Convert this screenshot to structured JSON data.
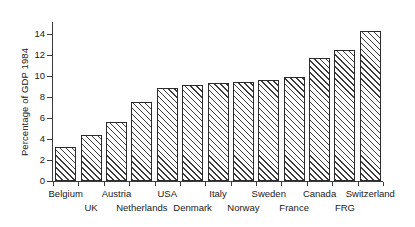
{
  "chart_data": {
    "type": "bar",
    "title": "",
    "subtitle": "",
    "xlabel": "",
    "ylabel": "Percentage of GDP 1984",
    "categories": [
      "Belgium",
      "UK",
      "Austria",
      "Netherlands",
      "USA",
      "Denmark",
      "Italy",
      "Norway",
      "Sweden",
      "France",
      "Canada",
      "FRG",
      "Switzerland"
    ],
    "values": [
      3.25,
      4.4,
      5.6,
      7.5,
      8.85,
      9.15,
      9.3,
      9.4,
      9.6,
      9.85,
      11.7,
      12.4,
      14.2
    ],
    "series": [
      {
        "name": "Percentage of GDP 1984",
        "values": [
          3.25,
          4.4,
          5.6,
          7.5,
          8.85,
          9.15,
          9.3,
          9.4,
          9.6,
          9.85,
          11.7,
          12.4,
          14.2
        ]
      }
    ],
    "ylim": [
      0,
      15
    ],
    "ytick_values": [
      0,
      2,
      4,
      6,
      8,
      10,
      12,
      14
    ],
    "ytick_labels": [
      "0",
      "2",
      "4",
      "6",
      "8",
      "10",
      "12",
      "14"
    ],
    "grid": false,
    "legend": null,
    "legend_position": "none",
    "bar_fill": "hatched-diagonal",
    "bar_edge_color": "#2b2b2b",
    "bar_hatch_color": "#3a3a3a",
    "axis_color": "#3b3b3b",
    "background_color": "#ffffff",
    "xlabel_rows": [
      0,
      1,
      0,
      1,
      0,
      1,
      0,
      1,
      0,
      1,
      0,
      1,
      0
    ],
    "annotations": []
  },
  "axes": {
    "y_axis_title": "Percentage of GDP 1984"
  }
}
